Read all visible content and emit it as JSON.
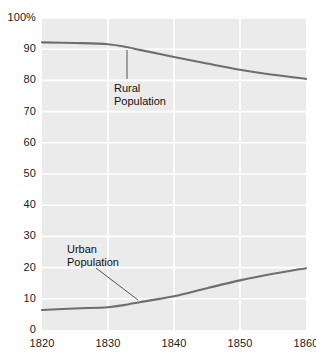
{
  "chart_data": {
    "type": "line",
    "title": "",
    "xlabel": "",
    "ylabel": "",
    "x": [
      1820,
      1830,
      1840,
      1850,
      1860
    ],
    "xlim": [
      1820,
      1860
    ],
    "ylim": [
      0,
      100
    ],
    "grid": true,
    "legend_position": "inline-annotations",
    "x_tick_labels": [
      "1820",
      "1830",
      "1840",
      "1850",
      "1860"
    ],
    "y_tick_labels": [
      "0",
      "10",
      "20",
      "30",
      "40",
      "50",
      "60",
      "70",
      "80",
      "90",
      "100%"
    ],
    "y_tick_values": [
      0,
      10,
      20,
      30,
      40,
      50,
      60,
      70,
      80,
      90,
      100
    ],
    "series": [
      {
        "name": "Rural Population",
        "color": "#6e6e6e",
        "x": [
          1820,
          1825,
          1830,
          1833,
          1835,
          1840,
          1845,
          1850,
          1855,
          1860
        ],
        "values": [
          92.2,
          92.0,
          91.6,
          90.6,
          89.7,
          87.5,
          85.4,
          83.4,
          81.8,
          80.5
        ]
      },
      {
        "name": "Urban Population",
        "color": "#6e6e6e",
        "x": [
          1820,
          1825,
          1830,
          1833,
          1835,
          1840,
          1845,
          1850,
          1855,
          1860
        ],
        "values": [
          6.4,
          6.9,
          7.3,
          8.2,
          9.0,
          10.8,
          13.4,
          15.9,
          18.0,
          19.8
        ]
      }
    ],
    "annotations": [
      {
        "name": "rural-population-annotation",
        "line1": "Rural",
        "line2": "Population",
        "label_x_px": 114,
        "label_y_px": 82,
        "leader": {
          "x1": 127,
          "y1": 79,
          "x2": 127,
          "y2": 50
        }
      },
      {
        "name": "urban-population-annotation",
        "line1": "Urban",
        "line2": "Population",
        "label_x_px": 67,
        "label_y_px": 243,
        "leader": {
          "x1": 96,
          "y1": 268,
          "x2": 138,
          "y2": 300
        }
      }
    ],
    "colors": {
      "plot_background": "#ebebeb",
      "gridline": "#ffffff",
      "line": "#6e6e6e",
      "text": "#1b1b1b",
      "page_background": "#ffffff"
    }
  }
}
